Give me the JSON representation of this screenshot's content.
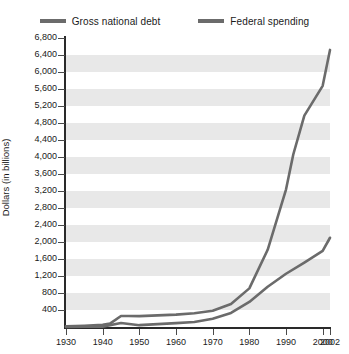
{
  "chart_data": {
    "type": "line",
    "title": "",
    "xlabel": "",
    "ylabel": "Dollars (in billions)",
    "xlim": [
      1930,
      2002
    ],
    "ylim": [
      0,
      6800
    ],
    "grid": true,
    "legend_position": "top",
    "y_ticks": [
      400,
      800,
      1200,
      1600,
      2000,
      2400,
      2800,
      3200,
      3600,
      4000,
      4400,
      4800,
      5200,
      5600,
      6000,
      6400,
      6800
    ],
    "y_tick_labels": [
      "400",
      "800",
      "1,200",
      "1,600",
      "2,000",
      "2,400",
      "2,800",
      "3,200",
      "3,600",
      "4,000",
      "4,400",
      "4,800",
      "5,200",
      "5,600",
      "6,000",
      "6,400",
      "6,800"
    ],
    "x_ticks": [
      1930,
      1940,
      1950,
      1960,
      1970,
      1980,
      1990,
      2000,
      2002
    ],
    "x_tick_labels": [
      "1930",
      "1940",
      "1950",
      "1960",
      "1970",
      "1980",
      "1990",
      "2000",
      "2002"
    ],
    "series": [
      {
        "name": "Gross national debt",
        "color": "#6b6b6b",
        "x": [
          1930,
          1935,
          1940,
          1942,
          1945,
          1947,
          1950,
          1955,
          1960,
          1965,
          1970,
          1975,
          1980,
          1985,
          1990,
          1992,
          1995,
          2000,
          2002
        ],
        "values": [
          16,
          29,
          51,
          79,
          260,
          258,
          257,
          274,
          291,
          323,
          381,
          542,
          909,
          1817,
          3233,
          4065,
          4974,
          5674,
          6520
        ]
      },
      {
        "name": "Federal spending",
        "color": "#6b6b6b",
        "x": [
          1930,
          1935,
          1940,
          1945,
          1950,
          1955,
          1960,
          1965,
          1970,
          1975,
          1980,
          1985,
          1990,
          1995,
          2000,
          2002
        ],
        "values": [
          3,
          6,
          9,
          93,
          43,
          68,
          92,
          118,
          196,
          332,
          591,
          946,
          1253,
          1516,
          1789,
          2100
        ]
      }
    ]
  },
  "legend": {
    "entries": [
      {
        "label": "Gross national debt"
      },
      {
        "label": "Federal spending"
      }
    ]
  }
}
